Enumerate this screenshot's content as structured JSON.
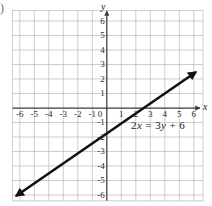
{
  "figure": {
    "corner_mark": ")",
    "equation_parts": {
      "coef_x": "2",
      "var_x": "x",
      "equals": "=",
      "coef_y": "3",
      "var_y": "y",
      "plus": "+",
      "constant": "6"
    },
    "equation_text": "2x = 3y + 6",
    "x_axis_name": "x",
    "y_axis_name": "y",
    "grid_color": "#b9b9b9",
    "axis_color": "#3a3a3a",
    "line_color": "#111111",
    "background": "#ffffff"
  },
  "chart_data": {
    "type": "line",
    "title": "",
    "xlabel": "x",
    "ylabel": "y",
    "grid": true,
    "legend": "none",
    "xlim": [
      -6.3,
      6.8
    ],
    "ylim": [
      -6.7,
      6.6
    ],
    "xticks": [
      -6,
      -5,
      -4,
      -3,
      -2,
      -1,
      0,
      1,
      2,
      3,
      4,
      5,
      6
    ],
    "yticks": [
      -6,
      -5,
      -4,
      -3,
      -2,
      -1,
      0,
      1,
      2,
      3,
      4,
      5,
      6
    ],
    "xtick_labels": [
      "-6",
      "-5",
      "-4",
      "-3",
      "-2",
      "-1",
      "0",
      "1",
      "2",
      "3",
      "4",
      "5",
      "6"
    ],
    "ytick_labels": [
      "-6",
      "-5",
      "-4",
      "-3",
      "-2",
      "-1",
      "0",
      "1",
      "2",
      "3",
      "4",
      "5",
      "6"
    ],
    "annotations": [
      "2x = 3y + 6"
    ],
    "series": [
      {
        "name": "2x = 3y + 6",
        "equation": "2x = 3y + 6",
        "slope": 0.6667,
        "y_intercept": -2,
        "x_intercept": 3,
        "arrows": "both",
        "x": [
          -6.3,
          6.8
        ],
        "y": [
          -6.2,
          2.53
        ]
      }
    ]
  }
}
